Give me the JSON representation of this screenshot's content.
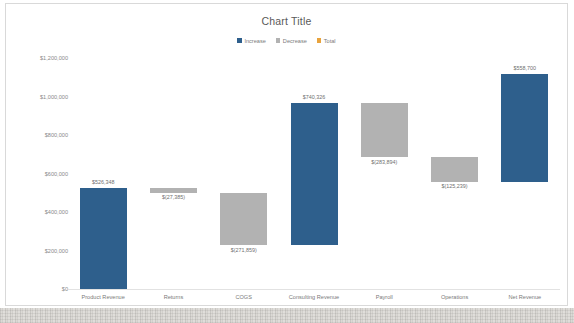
{
  "chart_data": {
    "type": "bar",
    "chart_subtype": "waterfall",
    "title": "Chart Title",
    "xlabel": "",
    "ylabel": "",
    "ylim": [
      0,
      1200000
    ],
    "grid": false,
    "legend_position": "top-center",
    "y_tick_labels": [
      "$1,200,000",
      "$1,000,000",
      "$800,000",
      "$600,000",
      "$400,000",
      "$200,000",
      "$0"
    ],
    "y_tick_values": [
      1200000,
      1000000,
      800000,
      600000,
      400000,
      200000,
      0
    ],
    "legend": [
      {
        "name": "Increase",
        "color": "#2E5F8C"
      },
      {
        "name": "Decrease",
        "color": "#B2B2B2"
      },
      {
        "name": "Total",
        "color": "#E8A33D"
      }
    ],
    "categories": [
      "Product Revenue",
      "Returns",
      "COGS",
      "Consulting Revenue",
      "Payroll",
      "Operations",
      "Net Revenue"
    ],
    "values": [
      526348,
      -27385,
      -271859,
      740326,
      -283894,
      -125239,
      558700
    ],
    "data_labels": [
      "$526,348",
      "$(27,385)",
      "$(271,859)",
      "$740,326",
      "$(283,894)",
      "$(125,239)",
      "$558,700"
    ],
    "bars": [
      {
        "category": "Product Revenue",
        "label": "$526,348",
        "value": 526348,
        "kind": "increase",
        "base": 0,
        "top": 526348,
        "color": "#2E5F8C",
        "label_position": "above"
      },
      {
        "category": "Returns",
        "label": "$(27,385)",
        "value": -27385,
        "kind": "decrease",
        "base": 498963,
        "top": 526348,
        "color": "#B2B2B2",
        "label_position": "below"
      },
      {
        "category": "COGS",
        "label": "$(271,859)",
        "value": -271859,
        "kind": "decrease",
        "base": 227104,
        "top": 498963,
        "color": "#B2B2B2",
        "label_position": "below"
      },
      {
        "category": "Consulting Revenue",
        "label": "$740,326",
        "value": 740326,
        "kind": "increase",
        "base": 227104,
        "top": 967430,
        "color": "#2E5F8C",
        "label_position": "above"
      },
      {
        "category": "Payroll",
        "label": "$(283,894)",
        "value": -283894,
        "kind": "decrease",
        "base": 683536,
        "top": 967430,
        "color": "#B2B2B2",
        "label_position": "below"
      },
      {
        "category": "Operations",
        "label": "$(125,239)",
        "value": -125239,
        "kind": "decrease",
        "base": 558297,
        "top": 683536,
        "color": "#B2B2B2",
        "label_position": "below"
      },
      {
        "category": "Net Revenue",
        "label": "$558,700",
        "value": 558700,
        "kind": "increase",
        "base": 558297,
        "top": 1116997,
        "color": "#2E5F8C",
        "label_position": "above"
      }
    ]
  }
}
